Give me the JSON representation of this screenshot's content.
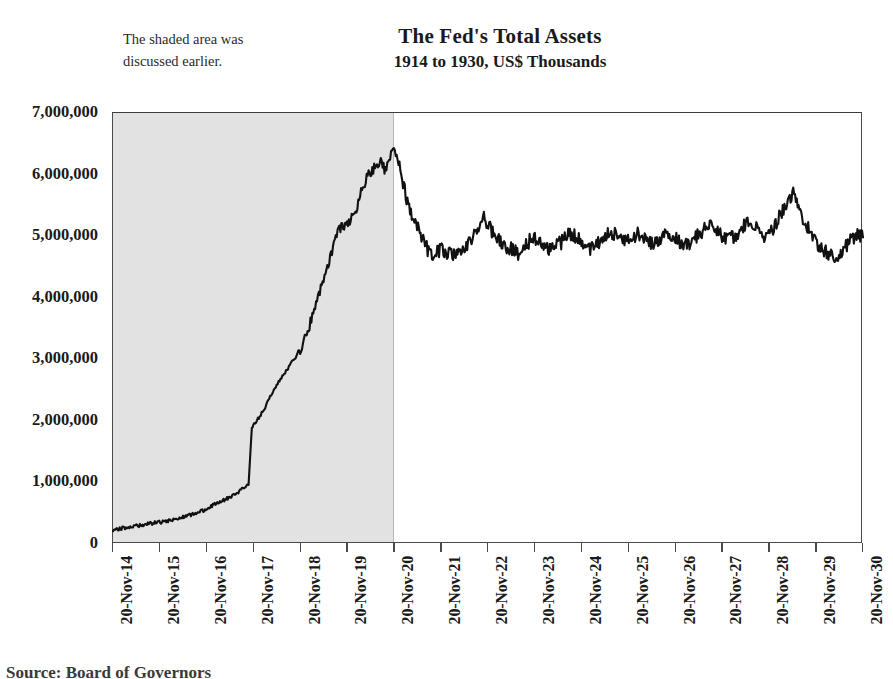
{
  "annotation": {
    "text": "The shaded area was discussed earlier."
  },
  "source": {
    "text": "Source: Board of Governors"
  },
  "chart_data": {
    "type": "line",
    "title": "The Fed's Total Assets",
    "subtitle": "1914 to 1930, US$ Thousands",
    "xlabel": "",
    "ylabel": "",
    "ylim": [
      0,
      7000000
    ],
    "ytick_values": [
      0,
      1000000,
      2000000,
      3000000,
      4000000,
      5000000,
      6000000,
      7000000
    ],
    "ytick_labels": [
      "0",
      "1,000,000",
      "2,000,000",
      "3,000,000",
      "4,000,000",
      "5,000,000",
      "6,000,000",
      "7,000,000"
    ],
    "xtick_labels": [
      "20-Nov-14",
      "20-Nov-15",
      "20-Nov-16",
      "20-Nov-17",
      "20-Nov-18",
      "20-Nov-19",
      "20-Nov-20",
      "20-Nov-21",
      "20-Nov-22",
      "20-Nov-23",
      "20-Nov-24",
      "20-Nov-25",
      "20-Nov-26",
      "20-Nov-27",
      "20-Nov-28",
      "20-Nov-29",
      "20-Nov-30"
    ],
    "xlim": [
      1914.888,
      1930.888
    ],
    "grid": false,
    "legend": null,
    "line_color": "#111111",
    "shaded_region": {
      "label": "The shaded area was discussed earlier.",
      "color": "#e2e2e2",
      "x_start": "20-Nov-14",
      "x_end": "20-Nov-20"
    },
    "units": "US$ Thousands",
    "annotations": [
      {
        "text": "peak of roughly 6,450,000 at 20-Nov-20, the right edge of the shaded band"
      },
      {
        "text": "sharp step up from about 950,000 to 1,900,000 during late 1917"
      },
      {
        "text": "post-1921 plateau oscillating between about 4,600,000 and 5,300,000"
      },
      {
        "text": "local spike near 5,700,000 in late 1929"
      }
    ],
    "series": [
      {
        "name": "Total Assets",
        "x": [
          1914.89,
          1915.05,
          1915.2,
          1915.35,
          1915.5,
          1915.65,
          1915.8,
          1915.95,
          1916.1,
          1916.25,
          1916.4,
          1916.55,
          1916.7,
          1916.85,
          1917.0,
          1917.15,
          1917.3,
          1917.45,
          1917.6,
          1917.7,
          1917.78,
          1917.85,
          1917.92,
          1918.0,
          1918.1,
          1918.2,
          1918.3,
          1918.4,
          1918.5,
          1918.6,
          1918.7,
          1918.8,
          1918.9,
          1919.0,
          1919.1,
          1919.2,
          1919.3,
          1919.4,
          1919.5,
          1919.6,
          1919.7,
          1919.8,
          1919.9,
          1920.0,
          1920.1,
          1920.2,
          1920.3,
          1920.4,
          1920.5,
          1920.6,
          1920.7,
          1920.8,
          1920.88,
          1921.0,
          1921.15,
          1921.3,
          1921.45,
          1921.6,
          1921.75,
          1921.9,
          1922.05,
          1922.2,
          1922.35,
          1922.5,
          1922.65,
          1922.8,
          1922.95,
          1923.1,
          1923.25,
          1923.4,
          1923.55,
          1923.7,
          1923.85,
          1924.0,
          1924.15,
          1924.3,
          1924.45,
          1924.6,
          1924.75,
          1924.9,
          1925.05,
          1925.2,
          1925.35,
          1925.5,
          1925.65,
          1925.8,
          1925.95,
          1926.1,
          1926.25,
          1926.4,
          1926.55,
          1926.7,
          1926.85,
          1927.0,
          1927.15,
          1927.3,
          1927.45,
          1927.6,
          1927.75,
          1927.9,
          1928.05,
          1928.2,
          1928.35,
          1928.5,
          1928.65,
          1928.8,
          1928.95,
          1929.1,
          1929.25,
          1929.4,
          1929.55,
          1929.7,
          1929.85,
          1930.0,
          1930.15,
          1930.3,
          1930.45,
          1930.6,
          1930.75,
          1930.888
        ],
        "y": [
          230000,
          250000,
          270000,
          290000,
          310000,
          330000,
          345000,
          360000,
          385000,
          410000,
          440000,
          470000,
          510000,
          560000,
          620000,
          680000,
          730000,
          790000,
          860000,
          930000,
          960000,
          1900000,
          1960000,
          2050000,
          2180000,
          2320000,
          2480000,
          2600000,
          2720000,
          2830000,
          2960000,
          3050000,
          3180000,
          3380000,
          3600000,
          3850000,
          4100000,
          4350000,
          4600000,
          4850000,
          5100000,
          5150000,
          5250000,
          5300000,
          5500000,
          5750000,
          5950000,
          6050000,
          6150000,
          6250000,
          6050000,
          6300000,
          6450000,
          6150000,
          5600000,
          5250000,
          5050000,
          4780000,
          4700000,
          4800000,
          4720000,
          4680000,
          4750000,
          4900000,
          5100000,
          5300000,
          5100000,
          4950000,
          4850000,
          4780000,
          4720000,
          4850000,
          5000000,
          4900000,
          4780000,
          4820000,
          4900000,
          5050000,
          5000000,
          4880000,
          4800000,
          4850000,
          4950000,
          5080000,
          5000000,
          4900000,
          4980000,
          5050000,
          4950000,
          4880000,
          4950000,
          5100000,
          5000000,
          4900000,
          4850000,
          4950000,
          5080000,
          5200000,
          5100000,
          5000000,
          4950000,
          5050000,
          5180000,
          5250000,
          5100000,
          5000000,
          5100000,
          5300000,
          5550000,
          5700000,
          5400000,
          5150000,
          4950000,
          4800000,
          4700000,
          4650000,
          4750000,
          4900000,
          5050000,
          4980000
        ]
      }
    ]
  }
}
